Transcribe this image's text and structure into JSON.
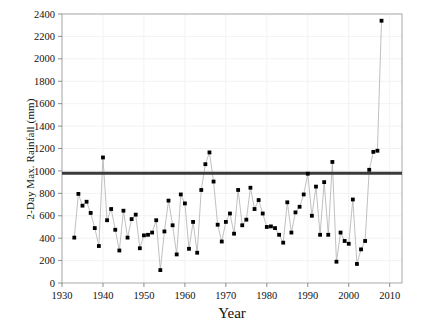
{
  "chart_data": {
    "type": "line",
    "title": "",
    "xlabel": "Year",
    "ylabel": "2-Day Max. Rainfall (mm)",
    "xlim": [
      1930,
      2013
    ],
    "ylim": [
      0,
      2400
    ],
    "xticks": [
      1930,
      1940,
      1950,
      1960,
      1970,
      1980,
      1990,
      2000,
      2010
    ],
    "yticks": [
      0,
      200,
      400,
      600,
      800,
      1000,
      1200,
      1400,
      1600,
      1800,
      2000,
      2200,
      2400
    ],
    "grid": true,
    "legend": "none",
    "marker": "filled-square",
    "marker_color": "#000000",
    "line_color": "#b0b0b0",
    "threshold_line": {
      "value": 980,
      "color": "#3b3b3b",
      "width_px": 3,
      "label": ""
    },
    "x": [
      1933,
      1934,
      1935,
      1936,
      1937,
      1938,
      1939,
      1940,
      1941,
      1942,
      1943,
      1944,
      1945,
      1946,
      1947,
      1948,
      1949,
      1950,
      1951,
      1952,
      1953,
      1954,
      1955,
      1956,
      1957,
      1958,
      1959,
      1960,
      1961,
      1962,
      1963,
      1964,
      1965,
      1966,
      1967,
      1968,
      1969,
      1970,
      1971,
      1972,
      1973,
      1974,
      1975,
      1976,
      1977,
      1978,
      1979,
      1980,
      1981,
      1982,
      1983,
      1984,
      1985,
      1986,
      1987,
      1988,
      1989,
      1990,
      1991,
      1992,
      1993,
      1994,
      1995,
      1996,
      1997,
      1998,
      1999,
      2000,
      2001,
      2002,
      2003,
      2004,
      2005,
      2006,
      2007,
      2008
    ],
    "values": [
      405,
      795,
      690,
      725,
      625,
      490,
      330,
      1120,
      560,
      660,
      475,
      290,
      645,
      405,
      570,
      610,
      310,
      425,
      430,
      450,
      560,
      115,
      460,
      735,
      515,
      255,
      790,
      710,
      305,
      545,
      270,
      830,
      1060,
      1165,
      905,
      520,
      370,
      545,
      620,
      440,
      830,
      515,
      565,
      850,
      660,
      740,
      620,
      500,
      505,
      490,
      430,
      360,
      720,
      450,
      630,
      680,
      790,
      975,
      600,
      860,
      430,
      900,
      430,
      1080,
      190,
      450,
      375,
      350,
      745,
      170,
      300,
      375,
      1010,
      1170,
      1180,
      2340
    ],
    "series_name": "2-Day Maximum Rainfall"
  },
  "axes": {
    "x_tick_labels": [
      "1930",
      "1940",
      "1950",
      "1960",
      "1970",
      "1980",
      "1990",
      "2000",
      "2010"
    ],
    "y_tick_labels": [
      "0",
      "200",
      "400",
      "600",
      "800",
      "1000",
      "1200",
      "1400",
      "1600",
      "1800",
      "2000",
      "2200",
      "2400"
    ]
  }
}
